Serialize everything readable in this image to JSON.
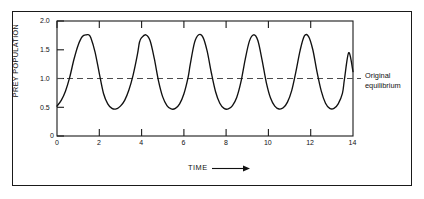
{
  "figure": {
    "background_color": "#ffffff",
    "frame_color": "#1a1a1a",
    "curve_color": "#111111",
    "equilibrium_line_color": "#555555"
  },
  "annotation": {
    "line1": "Original",
    "line2": "equilibrium"
  },
  "axes": {
    "x_title": "TIME",
    "y_title": "PREY POPULATION",
    "x_ticks": [
      "0",
      "2",
      "4",
      "6",
      "8",
      "10",
      "12",
      "14"
    ],
    "y_ticks": [
      "0",
      "0.5",
      "1.0",
      "1.5",
      "2.0"
    ]
  },
  "chart_data": {
    "type": "line",
    "title": "",
    "xlabel": "TIME",
    "ylabel": "PREY POPULATION",
    "xlim": [
      0,
      14
    ],
    "ylim": [
      0,
      2.0
    ],
    "grid": false,
    "legend": "none",
    "x_ticks": [
      0,
      2,
      4,
      6,
      8,
      10,
      12,
      14
    ],
    "y_ticks": [
      0,
      0.5,
      1.0,
      1.5,
      2.0
    ],
    "annotations": [
      {
        "text": "Original equilibrium",
        "y": 1.0,
        "type": "horizontal-dashed-line",
        "label_position": "right-outside"
      }
    ],
    "series": [
      {
        "name": "Prey population",
        "style": "solid",
        "color": "#111111",
        "period": 2.42,
        "peak_value": 1.76,
        "trough_value": 0.47,
        "equilibrium": 1.0,
        "peaks_x": [
          1.48,
          3.9,
          6.32,
          8.74,
          11.16,
          13.58
        ],
        "troughs_x": [
          2.55,
          4.97,
          7.39,
          9.81,
          12.23
        ],
        "x": [
          0.0,
          0.2,
          0.4,
          0.6,
          0.8,
          1.0,
          1.2,
          1.4,
          1.5,
          1.6,
          1.8,
          2.0,
          2.2,
          2.4,
          2.6,
          2.8,
          3.0,
          3.2,
          3.4,
          3.6,
          3.8,
          3.9,
          4.0,
          4.2,
          4.4,
          4.6,
          4.8,
          5.0,
          5.2,
          5.4,
          5.6,
          5.8,
          6.0,
          6.2,
          6.3,
          6.5,
          6.7,
          6.9,
          7.1,
          7.3,
          7.5,
          7.7,
          7.9,
          8.1,
          8.3,
          8.5,
          8.7,
          8.9,
          9.1,
          9.3,
          9.5,
          9.7,
          9.9,
          10.1,
          10.3,
          10.5,
          10.7,
          10.9,
          11.1,
          11.3,
          11.5,
          11.7,
          11.9,
          12.1,
          12.3,
          12.5,
          12.7,
          12.9,
          13.1,
          13.3,
          13.5,
          13.6,
          13.8,
          14.0
        ],
        "y": [
          0.52,
          0.62,
          0.78,
          1.02,
          1.33,
          1.58,
          1.73,
          1.76,
          1.76,
          1.71,
          1.46,
          1.09,
          0.74,
          0.56,
          0.48,
          0.47,
          0.52,
          0.62,
          0.8,
          1.06,
          1.41,
          1.63,
          1.71,
          1.76,
          1.66,
          1.35,
          0.96,
          0.68,
          0.53,
          0.47,
          0.48,
          0.56,
          0.73,
          1.02,
          1.24,
          1.62,
          1.76,
          1.72,
          1.48,
          1.1,
          0.77,
          0.57,
          0.48,
          0.47,
          0.53,
          0.67,
          0.94,
          1.33,
          1.65,
          1.76,
          1.66,
          1.32,
          0.93,
          0.66,
          0.52,
          0.47,
          0.49,
          0.59,
          0.79,
          1.12,
          1.49,
          1.74,
          1.73,
          1.5,
          1.11,
          0.78,
          0.57,
          0.48,
          0.48,
          0.56,
          0.74,
          1.0,
          1.45,
          1.12
        ]
      }
    ]
  }
}
